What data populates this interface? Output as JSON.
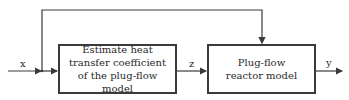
{
  "diagram": {
    "type": "block-diagram",
    "blocks": [
      {
        "id": "estimator",
        "label": "Estimate heat transfer coefficient of the plug-flow model"
      },
      {
        "id": "reactor",
        "label": "Plug-flow reactor model"
      }
    ],
    "signals": {
      "input": "x",
      "intermediate": "z",
      "output": "y"
    },
    "edges": [
      {
        "from": "x",
        "to": "estimator",
        "label": "x"
      },
      {
        "from": "x",
        "to": "reactor",
        "label": "x (feedforward)"
      },
      {
        "from": "estimator",
        "to": "reactor",
        "label": "z"
      },
      {
        "from": "reactor",
        "to": "output",
        "label": "y"
      }
    ],
    "colors": {
      "line": "#3a3a3a",
      "background": "#ffffff"
    }
  }
}
